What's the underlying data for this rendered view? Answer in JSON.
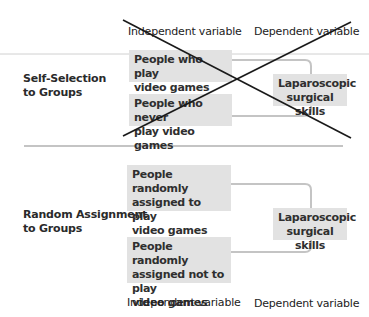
{
  "top_section": {
    "header_iv": "Independent variable",
    "header_dv": "Dependent variable",
    "row_label_line1": "Self-Selection",
    "row_label_line2": "to Groups",
    "iv_boxes": [
      {
        "line1": "People who play",
        "line2": "video games regularly"
      },
      {
        "line1": "People who never",
        "line2": "play video games"
      }
    ],
    "dv_box": {
      "line1": "Laparoscopic",
      "line2": "surgical skills"
    },
    "crossed_out": true
  },
  "bottom_section": {
    "row_label_line1": "Random Assignment",
    "row_label_line2": "to Groups",
    "iv_boxes": [
      {
        "line1": "People randomly",
        "line2": "assigned to play",
        "line3": "video games"
      },
      {
        "line1": "People randomly",
        "line2": "assigned not to play",
        "line3": "video games"
      }
    ],
    "dv_box": {
      "line1": "Laparoscopic",
      "line2": "surgical skills"
    },
    "footer_iv": "Independent variable",
    "footer_dv": "Dependent variable"
  },
  "colors": {
    "box_fill": "#e2e2e2",
    "connector": "#c4c4c4",
    "divider": "#8a8a8a",
    "top_rule": "#d0d0d0",
    "cross": "#1a1a1a"
  }
}
